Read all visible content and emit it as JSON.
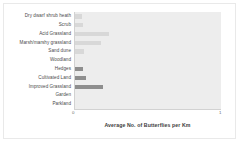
{
  "chart_data": {
    "type": "bar",
    "orientation": "horizontal",
    "title": "",
    "xlabel": "Average No. of Butterflies per Km",
    "ylabel": "",
    "xlim": [
      0,
      1
    ],
    "x_tick_labels": [
      "0",
      "1"
    ],
    "grid": false,
    "legend": false,
    "categories": [
      "Dry dwarf shrub heath",
      "Scrub",
      "Acid Grassland",
      "Marsh/marshy grassland",
      "Sand dune",
      "Woodland",
      "Hedges",
      "Cultivated Land",
      "Improved Grassland",
      "Garden",
      "Parkland"
    ],
    "values": [
      0.05,
      0.055,
      0.23,
      0.18,
      0.06,
      0.0,
      0.055,
      0.075,
      0.19,
      0.0,
      0.0
    ],
    "bar_colors": [
      "#d8d8d8",
      "#d8d8d8",
      "#d8d8d8",
      "#d8d8d8",
      "#d8d8d8",
      "#d8d8d8",
      "#8e8e8e",
      "#8e8e8e",
      "#8e8e8e",
      "#8e8e8e",
      "#8e8e8e"
    ],
    "plot_background": "#ededed",
    "axis_color": "#d2d2d2"
  }
}
